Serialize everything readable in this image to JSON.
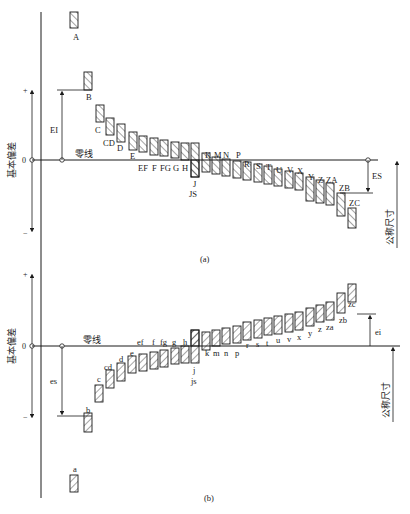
{
  "diagram": {
    "colors": {
      "line": "#1a1a1a",
      "text": "#222222",
      "background": "#ffffff"
    }
  },
  "left_axis": {
    "label": "基本偏差",
    "plus": "+",
    "minus": "−",
    "zero": "0"
  },
  "panel_a": {
    "caption": "(a)",
    "zero_line_label": "零线",
    "EI_label": "EI",
    "ES_label": "ES",
    "nominal_label": "公称尺寸",
    "zero_y": 160,
    "bars": [
      {
        "label": "A",
        "x": 70,
        "y1": 12,
        "y2": 28,
        "lx": 73,
        "ly": 40
      },
      {
        "label": "B",
        "x": 84,
        "y1": 72,
        "y2": 90,
        "lx": 86,
        "ly": 100
      },
      {
        "label": "C",
        "x": 96,
        "y1": 105,
        "y2": 122,
        "lx": 95,
        "ly": 133
      },
      {
        "label": "CD",
        "x": 106,
        "y1": 118,
        "y2": 135,
        "lx": 103,
        "ly": 146
      },
      {
        "label": "D",
        "x": 117,
        "y1": 124,
        "y2": 142,
        "lx": 117,
        "ly": 151
      },
      {
        "label": "E",
        "x": 129,
        "y1": 132,
        "y2": 150,
        "lx": 130,
        "ly": 159
      },
      {
        "label": "EF",
        "x": 139,
        "y1": 136,
        "y2": 152,
        "lx": 138,
        "ly": 171
      },
      {
        "label": "F",
        "x": 150,
        "y1": 138,
        "y2": 155,
        "lx": 152,
        "ly": 171
      },
      {
        "label": "FG",
        "x": 160,
        "y1": 140,
        "y2": 156,
        "lx": 160,
        "ly": 171
      },
      {
        "label": "G",
        "x": 171,
        "y1": 142,
        "y2": 158,
        "lx": 173,
        "ly": 171
      },
      {
        "label": "H",
        "x": 181,
        "y1": 143,
        "y2": 160,
        "lx": 182,
        "ly": 171
      },
      {
        "label": "J",
        "x": 191,
        "y1": 143,
        "y2": 177,
        "lx": 193,
        "ly": 187
      },
      {
        "label": "JS",
        "x": 191,
        "y1": 160,
        "y2": 177,
        "lx": 189,
        "ly": 197
      },
      {
        "label": "K",
        "x": 202,
        "y1": 153,
        "y2": 172,
        "lx": 205,
        "ly": 158
      },
      {
        "label": "M",
        "x": 212,
        "y1": 157,
        "y2": 174,
        "lx": 214,
        "ly": 158
      },
      {
        "label": "N",
        "x": 222,
        "y1": 159,
        "y2": 176,
        "lx": 223,
        "ly": 158
      },
      {
        "label": "P",
        "x": 233,
        "y1": 161,
        "y2": 178,
        "lx": 236,
        "ly": 158
      },
      {
        "label": "R",
        "x": 243,
        "y1": 162,
        "y2": 180,
        "lx": 244,
        "ly": 167
      },
      {
        "label": "S",
        "x": 254,
        "y1": 164,
        "y2": 182,
        "lx": 256,
        "ly": 169
      },
      {
        "label": "T",
        "x": 264,
        "y1": 166,
        "y2": 184,
        "lx": 266,
        "ly": 170
      },
      {
        "label": "U",
        "x": 274,
        "y1": 169,
        "y2": 186,
        "lx": 276,
        "ly": 173
      },
      {
        "label": "V",
        "x": 285,
        "y1": 171,
        "y2": 188,
        "lx": 287,
        "ly": 173
      },
      {
        "label": "X",
        "x": 295,
        "y1": 173,
        "y2": 190,
        "lx": 297,
        "ly": 174
      },
      {
        "label": "Y",
        "x": 306,
        "y1": 177,
        "y2": 201,
        "lx": 308,
        "ly": 180
      },
      {
        "label": "Z",
        "x": 316,
        "y1": 180,
        "y2": 203,
        "lx": 318,
        "ly": 183
      },
      {
        "label": "ZA",
        "x": 326,
        "y1": 183,
        "y2": 205,
        "lx": 326,
        "ly": 183
      },
      {
        "label": "ZB",
        "x": 337,
        "y1": 193,
        "y2": 216,
        "lx": 339,
        "ly": 191
      },
      {
        "label": "ZC",
        "x": 348,
        "y1": 208,
        "y2": 228,
        "lx": 349,
        "ly": 206
      }
    ]
  },
  "panel_b": {
    "caption": "(b)",
    "zero_line_label": "零线",
    "es_label": "es",
    "ei_label": "ei",
    "nominal_label": "公称尺寸",
    "zero_y": 346,
    "bars": [
      {
        "label": "a",
        "x": 70,
        "y1": 475,
        "y2": 492,
        "lx": 73,
        "ly": 472
      },
      {
        "label": "b",
        "x": 84,
        "y1": 413,
        "y2": 432,
        "lx": 86,
        "ly": 413
      },
      {
        "label": "c",
        "x": 95,
        "y1": 385,
        "y2": 402,
        "lx": 97,
        "ly": 382
      },
      {
        "label": "cd",
        "x": 106,
        "y1": 370,
        "y2": 388,
        "lx": 104,
        "ly": 370
      },
      {
        "label": "d",
        "x": 117,
        "y1": 363,
        "y2": 381,
        "lx": 119,
        "ly": 362
      },
      {
        "label": "e",
        "x": 128,
        "y1": 356,
        "y2": 373,
        "lx": 130,
        "ly": 356
      },
      {
        "label": "ef",
        "x": 139,
        "y1": 354,
        "y2": 371,
        "lx": 137,
        "ly": 345
      },
      {
        "label": "f",
        "x": 150,
        "y1": 352,
        "y2": 369,
        "lx": 152,
        "ly": 345
      },
      {
        "label": "fg",
        "x": 160,
        "y1": 350,
        "y2": 367,
        "lx": 160,
        "ly": 345
      },
      {
        "label": "g",
        "x": 171,
        "y1": 348,
        "y2": 364,
        "lx": 172,
        "ly": 345
      },
      {
        "label": "h",
        "x": 181,
        "y1": 346,
        "y2": 363,
        "lx": 183,
        "ly": 345
      },
      {
        "label": "j",
        "x": 191,
        "y1": 330,
        "y2": 363,
        "lx": 193,
        "ly": 373
      },
      {
        "label": "js",
        "x": 191,
        "y1": 330,
        "y2": 346,
        "lx": 191,
        "ly": 384
      },
      {
        "label": "k",
        "x": 202,
        "y1": 332,
        "y2": 350,
        "lx": 205,
        "ly": 356
      },
      {
        "label": "m",
        "x": 212,
        "y1": 330,
        "y2": 346,
        "lx": 213,
        "ly": 356
      },
      {
        "label": "n",
        "x": 222,
        "y1": 328,
        "y2": 344,
        "lx": 224,
        "ly": 356
      },
      {
        "label": "p",
        "x": 233,
        "y1": 326,
        "y2": 343,
        "lx": 235,
        "ly": 356
      },
      {
        "label": "r",
        "x": 243,
        "y1": 322,
        "y2": 340,
        "lx": 246,
        "ly": 348
      },
      {
        "label": "s",
        "x": 254,
        "y1": 320,
        "y2": 338,
        "lx": 256,
        "ly": 347
      },
      {
        "label": "t",
        "x": 264,
        "y1": 318,
        "y2": 335,
        "lx": 266,
        "ly": 346
      },
      {
        "label": "u",
        "x": 274,
        "y1": 316,
        "y2": 334,
        "lx": 276,
        "ly": 343
      },
      {
        "label": "v",
        "x": 285,
        "y1": 314,
        "y2": 332,
        "lx": 287,
        "ly": 342
      },
      {
        "label": "x",
        "x": 295,
        "y1": 312,
        "y2": 330,
        "lx": 297,
        "ly": 340
      },
      {
        "label": "y",
        "x": 306,
        "y1": 308,
        "y2": 326,
        "lx": 308,
        "ly": 336
      },
      {
        "label": "z",
        "x": 316,
        "y1": 305,
        "y2": 322,
        "lx": 318,
        "ly": 332
      },
      {
        "label": "za",
        "x": 326,
        "y1": 302,
        "y2": 320,
        "lx": 326,
        "ly": 330
      },
      {
        "label": "zb",
        "x": 337,
        "y1": 293,
        "y2": 313,
        "lx": 339,
        "ly": 323
      },
      {
        "label": "zc",
        "x": 348,
        "y1": 284,
        "y2": 302,
        "lx": 348,
        "ly": 307
      }
    ]
  }
}
